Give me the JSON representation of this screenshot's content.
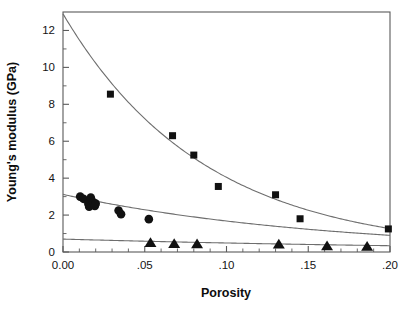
{
  "chart_data": {
    "type": "scatter",
    "title": "",
    "subtitle": "",
    "xlabel": "Porosity",
    "ylabel": "Young's modulus (GPa)",
    "xlim": [
      0.0,
      0.2
    ],
    "ylim": [
      0,
      13.0
    ],
    "xticks": [
      0.0,
      0.05,
      0.1,
      0.15,
      0.2
    ],
    "xticklabels": [
      "0.00",
      ".05",
      ".10",
      ".15",
      ".20"
    ],
    "yticks": [
      0,
      2,
      4,
      6,
      8,
      10,
      12
    ],
    "yticklabels": [
      "0",
      "2",
      "4",
      "6",
      "8",
      "10",
      "12"
    ],
    "xminorticks": [
      0.01,
      0.02,
      0.03,
      0.04,
      0.06,
      0.07,
      0.08,
      0.09,
      0.11,
      0.12,
      0.13,
      0.14,
      0.16,
      0.17,
      0.18,
      0.19
    ],
    "yminorticks": [
      1,
      3,
      5,
      7,
      9,
      11
    ],
    "grid": false,
    "legend": false,
    "legend_position": "none",
    "frame": "full-box",
    "marker_color": "#111111",
    "line_color": "#6e6e6e",
    "axis_color": "#5a5a5a",
    "series": [
      {
        "name": "squares",
        "marker": "square",
        "points": [
          {
            "x": 0.029,
            "y": 8.55
          },
          {
            "x": 0.067,
            "y": 6.3
          },
          {
            "x": 0.08,
            "y": 5.25
          },
          {
            "x": 0.095,
            "y": 3.55
          },
          {
            "x": 0.13,
            "y": 3.1
          },
          {
            "x": 0.145,
            "y": 1.8
          },
          {
            "x": 0.199,
            "y": 1.25
          }
        ],
        "fit": {
          "model": "exponential",
          "equation": "E = 12.9 * exp(-11.6 * P)",
          "y0": 12.9,
          "rate": 11.6
        }
      },
      {
        "name": "circles",
        "marker": "circle",
        "points": [
          {
            "x": 0.0105,
            "y": 3.0
          },
          {
            "x": 0.0125,
            "y": 2.88
          },
          {
            "x": 0.0155,
            "y": 2.62
          },
          {
            "x": 0.016,
            "y": 2.45
          },
          {
            "x": 0.017,
            "y": 2.95
          },
          {
            "x": 0.0185,
            "y": 2.7
          },
          {
            "x": 0.0195,
            "y": 2.5
          },
          {
            "x": 0.02,
            "y": 2.62
          },
          {
            "x": 0.034,
            "y": 2.25
          },
          {
            "x": 0.0355,
            "y": 2.05
          },
          {
            "x": 0.0525,
            "y": 1.78
          }
        ],
        "fit": {
          "model": "exponential",
          "equation": "E = 3.12 * exp(-6.2 * P)",
          "y0": 3.12,
          "rate": 6.2
        }
      },
      {
        "name": "triangles",
        "marker": "triangle",
        "points": [
          {
            "x": 0.0535,
            "y": 0.5
          },
          {
            "x": 0.068,
            "y": 0.45
          },
          {
            "x": 0.082,
            "y": 0.44
          },
          {
            "x": 0.132,
            "y": 0.42
          },
          {
            "x": 0.1615,
            "y": 0.33
          },
          {
            "x": 0.186,
            "y": 0.3
          }
        ],
        "fit": {
          "model": "exponential",
          "equation": "E = 0.70 * exp(-3.6 * P)",
          "y0": 0.7,
          "rate": 3.6
        }
      }
    ]
  },
  "figure": {
    "caption": ""
  }
}
